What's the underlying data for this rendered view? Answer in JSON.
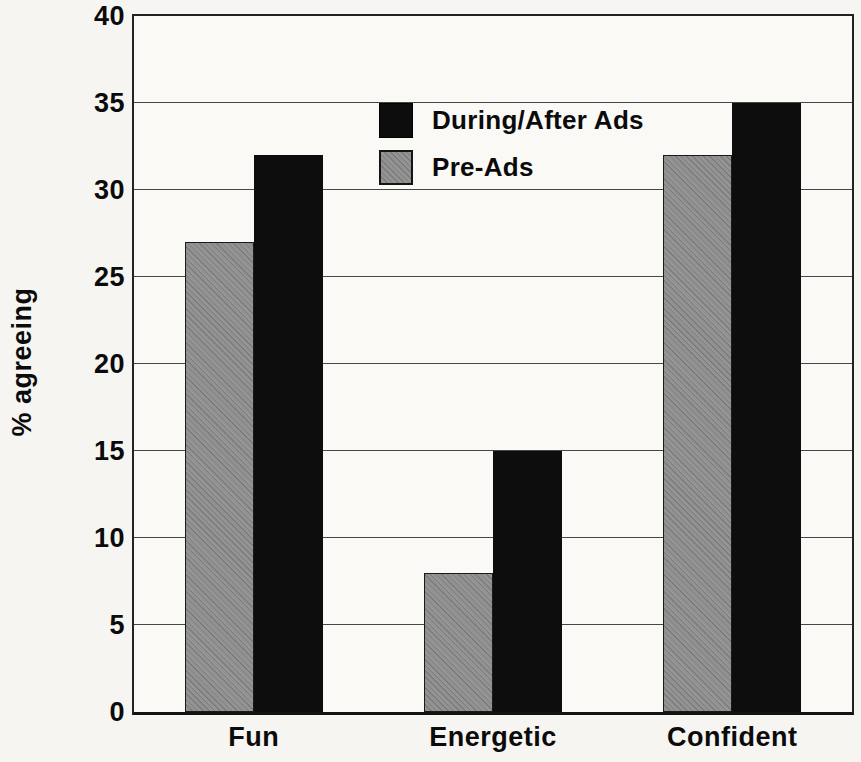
{
  "chart_data": {
    "type": "bar",
    "title": "",
    "categories": [
      "Fun",
      "Energetic",
      "Confident"
    ],
    "series": [
      {
        "name": "During/After Ads",
        "color": "#0d0d0d",
        "pattern": "solid",
        "values": [
          32,
          15,
          35
        ]
      },
      {
        "name": "Pre-Ads",
        "color": "#919191",
        "pattern": "diagonal-hatch",
        "values": [
          27,
          8,
          32
        ]
      }
    ],
    "bar_draw_order": [
      1,
      0
    ],
    "xlabel": "",
    "ylabel": "% agreeing",
    "ylim": [
      0,
      40
    ],
    "yticks": [
      0,
      5,
      10,
      15,
      20,
      25,
      30,
      35,
      40
    ],
    "grid": true,
    "legend_position": "inside-upper-middle-left",
    "colors": {
      "background": "#f6f5f2",
      "plot_background": "#faf9f6",
      "gridline": "#474747",
      "axis_border": "#222222",
      "text": "#0b0b0b"
    }
  }
}
